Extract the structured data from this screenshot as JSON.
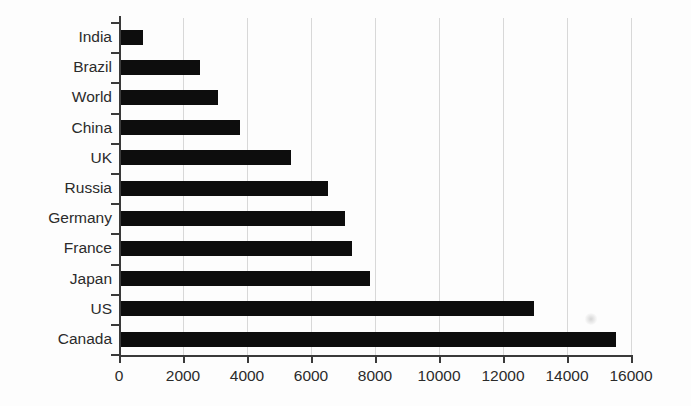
{
  "chart_data": {
    "type": "bar",
    "orientation": "horizontal",
    "title": "",
    "xlabel": "",
    "ylabel": "",
    "categories": [
      "India",
      "Brazil",
      "World",
      "China",
      "UK",
      "Russia",
      "Germany",
      "France",
      "Japan",
      "US",
      "Canada"
    ],
    "values": [
      750,
      2530,
      3090,
      3780,
      5380,
      6530,
      7060,
      7280,
      7840,
      12970,
      15530
    ],
    "xlim": [
      0,
      16000
    ],
    "xticks": [
      0,
      2000,
      4000,
      6000,
      8000,
      10000,
      12000,
      14000,
      16000
    ],
    "xtick_labels": [
      "0",
      "2000",
      "4000",
      "6000",
      "8000",
      "10000",
      "12000",
      "14000",
      "16000"
    ],
    "grid": "vertical",
    "legend": "none",
    "bar_color": "#0d0d0d",
    "grid_color": "#d8d8d8",
    "axis_color": "#3a3a3a"
  }
}
